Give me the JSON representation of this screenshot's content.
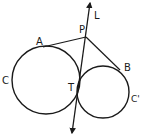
{
  "diagram": {
    "type": "geometry",
    "labels": {
      "L": "L",
      "P": "P",
      "A": "A",
      "B": "B",
      "C": "C",
      "C_prime": "C'",
      "T": "T"
    },
    "stroke_color": "#1a1a1a",
    "background": "#ffffff",
    "elements": {
      "circle_C": {
        "cx": 46,
        "cy": 80,
        "r": 34
      },
      "circle_C_prime": {
        "cx": 103,
        "cy": 92,
        "r": 26
      },
      "point_P": {
        "x": 86,
        "y": 37
      },
      "point_A": {
        "x": 43,
        "y": 47
      },
      "point_B": {
        "x": 120,
        "y": 70
      },
      "point_T": {
        "x": 78,
        "y": 90
      },
      "line_L": {
        "x1": 90,
        "y1": 3,
        "x2": 72,
        "y2": 133
      }
    }
  }
}
